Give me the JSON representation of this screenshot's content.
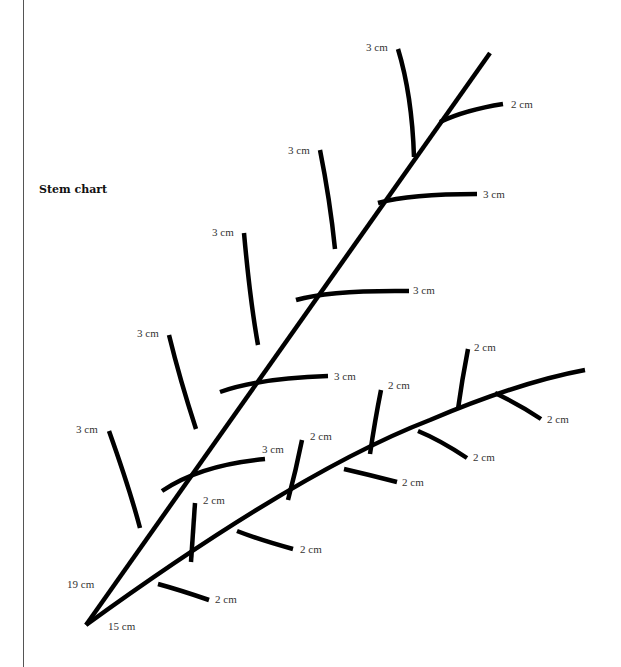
{
  "title": "Stem chart",
  "colors": {
    "stem": "#000000",
    "label": "#333333",
    "background": "#ffffff"
  },
  "stems": [
    {
      "name": "upper-stem",
      "length_label": "19 cm",
      "branches": [
        {
          "side": "left",
          "label": "3 cm"
        },
        {
          "side": "right",
          "label": "3 cm"
        },
        {
          "side": "left",
          "label": "3 cm"
        },
        {
          "side": "right",
          "label": "3 cm"
        },
        {
          "side": "left",
          "label": "3 cm"
        },
        {
          "side": "right",
          "label": "3 cm"
        },
        {
          "side": "left",
          "label": "3 cm"
        },
        {
          "side": "right",
          "label": "3 cm"
        },
        {
          "side": "left",
          "label": "3 cm"
        },
        {
          "side": "right",
          "label": "2 cm"
        }
      ]
    },
    {
      "name": "lower-stem",
      "length_label": "15 cm",
      "branches": [
        {
          "side": "right",
          "label": "2 cm"
        },
        {
          "side": "left",
          "label": "2 cm"
        },
        {
          "side": "right",
          "label": "2 cm"
        },
        {
          "side": "left",
          "label": "2 cm"
        },
        {
          "side": "right",
          "label": "2 cm"
        },
        {
          "side": "left",
          "label": "2 cm"
        },
        {
          "side": "right",
          "label": "2 cm"
        },
        {
          "side": "left",
          "label": "2 cm"
        },
        {
          "side": "right",
          "label": "2 cm"
        }
      ]
    }
  ]
}
